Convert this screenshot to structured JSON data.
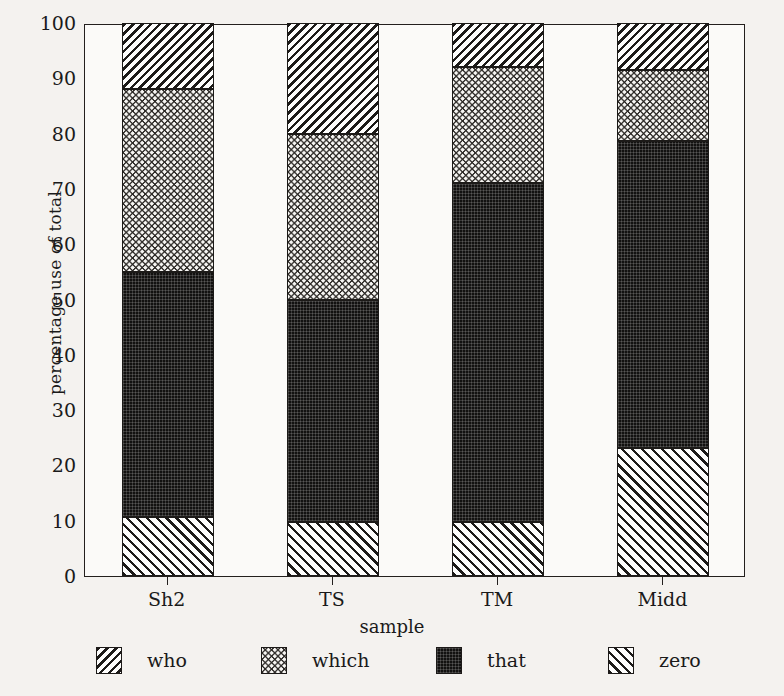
{
  "chart_data": {
    "type": "bar",
    "subtype": "stacked-bar-100-percent",
    "title": "",
    "xlabel": "sample",
    "ylabel": "percentage use of total",
    "categories": [
      "Sh2",
      "TS",
      "TM",
      "Midd"
    ],
    "ylim": [
      0,
      100
    ],
    "yticks": [
      0,
      10,
      20,
      30,
      40,
      50,
      60,
      70,
      80,
      90,
      100
    ],
    "grid": false,
    "legend_position": "bottom",
    "stack_order_bottom_to_top": [
      "zero",
      "that",
      "which",
      "who"
    ],
    "series": [
      {
        "name": "who",
        "values": [
          12.0,
          20.0,
          8.0,
          8.5
        ]
      },
      {
        "name": "which",
        "values": [
          33.0,
          30.0,
          21.0,
          12.8
        ]
      },
      {
        "name": "that",
        "values": [
          44.3,
          40.2,
          61.2,
          55.6
        ]
      },
      {
        "name": "zero",
        "values": [
          10.7,
          9.8,
          9.8,
          23.1
        ]
      }
    ],
    "cumulative_tops": {
      "Sh2": {
        "zero": 10.7,
        "that": 55.0,
        "which": 88.0,
        "who": 100
      },
      "TS": {
        "zero": 9.8,
        "that": 50.0,
        "which": 80.0,
        "who": 100
      },
      "TM": {
        "zero": 9.8,
        "that": 71.0,
        "which": 92.0,
        "who": 100
      },
      "Midd": {
        "zero": 23.1,
        "that": 78.7,
        "which": 91.5,
        "who": 100
      }
    },
    "legend": [
      {
        "label": "who",
        "pattern": "backslash-hatch"
      },
      {
        "label": "which",
        "pattern": "crosshatch-zigzag"
      },
      {
        "label": "that",
        "pattern": "solid-dark-grid"
      },
      {
        "label": "zero",
        "pattern": "forwardslash-hatch"
      }
    ],
    "colors": {
      "ink": "#1c1a18",
      "paper": "#fbfaf8",
      "that_fill": "#121110"
    }
  }
}
